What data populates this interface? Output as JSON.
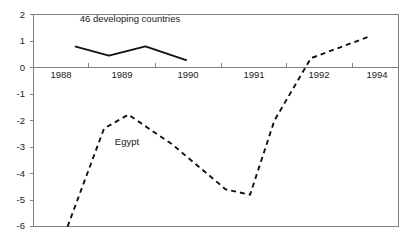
{
  "chart_data": {
    "type": "line",
    "title": "",
    "subtitle": "",
    "xlabel": "",
    "ylabel": "",
    "xlim": [
      1987.5,
      1995.0
    ],
    "ylim": [
      -6,
      2
    ],
    "grid": false,
    "legend_position": "inline-annotation",
    "y_ticks": [
      "2",
      "1",
      "0",
      "-1",
      "-2",
      "-3",
      "-4",
      "-5",
      "-6"
    ],
    "y_tick_values": [
      2,
      1,
      0,
      -1,
      -2,
      -3,
      -4,
      -5,
      -6
    ],
    "x_tick_labels": [
      "1988",
      "1989",
      "1990",
      "1991",
      "1992",
      "1994"
    ],
    "annotations": [
      {
        "text": "46 developing countries",
        "x": 1989.1,
        "y": 1.62
      },
      {
        "text": "Egypt",
        "x": 1989.55,
        "y": -2.95
      }
    ],
    "series": [
      {
        "name": "46 developing countries",
        "style": "solid",
        "x": [
          1988.35,
          1989.05,
          1989.8,
          1990.65
        ],
        "values": [
          0.8,
          0.45,
          0.8,
          0.27
        ]
      },
      {
        "name": "Egypt",
        "style": "dashed",
        "x": [
          1988.2,
          1988.95,
          1989.45,
          1990.35,
          1991.45,
          1991.95,
          1992.45,
          1993.2,
          1994.4
        ],
        "values": [
          -6.0,
          -2.3,
          -1.78,
          -2.9,
          -4.6,
          -4.8,
          -2.0,
          0.35,
          1.17
        ]
      }
    ]
  }
}
